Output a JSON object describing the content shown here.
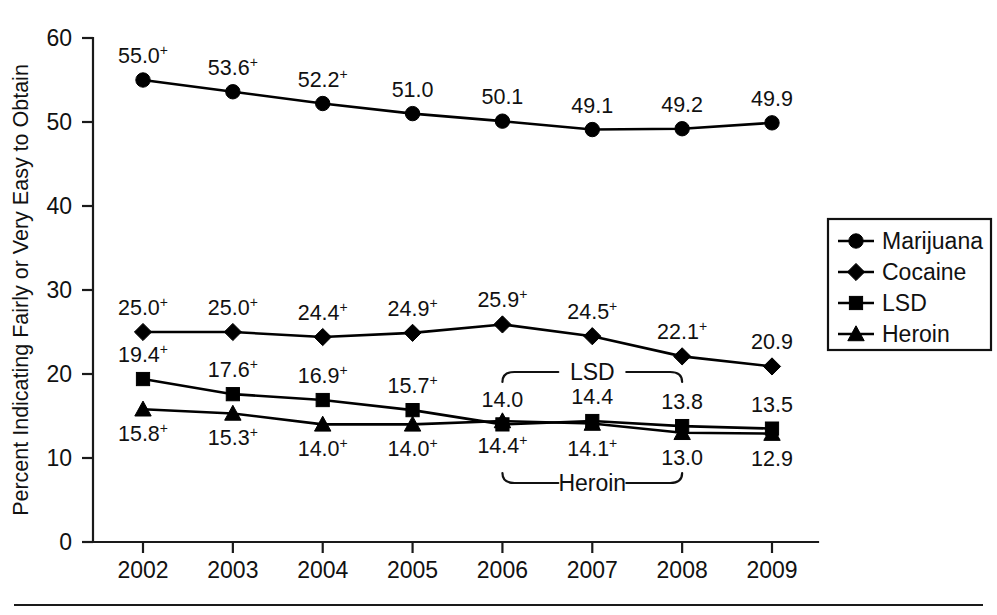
{
  "chart_data": {
    "type": "line",
    "title": "",
    "subtitle": "",
    "xlabel": "",
    "ylabel": "Percent Indicating Fairly or Very Easy to Obtain",
    "categories": [
      "2002",
      "2003",
      "2004",
      "2005",
      "2006",
      "2007",
      "2008",
      "2009"
    ],
    "x": [
      2002,
      2003,
      2004,
      2005,
      2006,
      2007,
      2008,
      2009
    ],
    "xlim": [
      2002,
      2009
    ],
    "ylim": [
      0,
      60
    ],
    "yticks": [
      0,
      10,
      20,
      30,
      40,
      50,
      60
    ],
    "ytick_labels": [
      "0",
      "10",
      "20",
      "30",
      "40",
      "50",
      "60"
    ],
    "grid": false,
    "legend_position": "right",
    "series": [
      {
        "name": "Marijuana",
        "marker": "circle",
        "values": [
          55.0,
          53.6,
          52.2,
          51.0,
          50.1,
          49.1,
          49.2,
          49.9
        ],
        "labels": [
          "55.0",
          "53.6",
          "52.2",
          "51.0",
          "50.1",
          "49.1",
          "49.2",
          "49.9"
        ],
        "significance": [
          "+",
          "+",
          "+",
          "",
          "",
          "",
          "",
          ""
        ],
        "label_position": "above"
      },
      {
        "name": "Cocaine",
        "marker": "diamond",
        "values": [
          25.0,
          25.0,
          24.4,
          24.9,
          25.9,
          24.5,
          22.1,
          20.9
        ],
        "labels": [
          "25.0",
          "25.0",
          "24.4",
          "24.9",
          "25.9",
          "24.5",
          "22.1",
          "20.9"
        ],
        "significance": [
          "+",
          "+",
          "+",
          "+",
          "+",
          "+",
          "+",
          ""
        ],
        "label_position": "above"
      },
      {
        "name": "LSD",
        "marker": "square",
        "values": [
          19.4,
          17.6,
          16.9,
          15.7,
          14.0,
          14.4,
          13.8,
          13.5
        ],
        "labels": [
          "19.4",
          "17.6",
          "16.9",
          "15.7",
          "14.0",
          "14.4",
          "13.8",
          "13.5"
        ],
        "significance": [
          "+",
          "+",
          "+",
          "+",
          "",
          "",
          "",
          ""
        ],
        "label_position": "above"
      },
      {
        "name": "Heroin",
        "marker": "triangle",
        "values": [
          15.8,
          15.3,
          14.0,
          14.0,
          14.4,
          14.1,
          13.0,
          12.9
        ],
        "labels": [
          "15.8",
          "15.3",
          "14.0",
          "14.0",
          "14.4",
          "14.1",
          "13.0",
          "12.9"
        ],
        "significance": [
          "+",
          "+",
          "+",
          "+",
          "+",
          "+",
          "",
          ""
        ],
        "label_position": "below"
      }
    ],
    "annotations": [
      {
        "text": "LSD",
        "from_category": "2006",
        "to_category": "2008",
        "orientation": "down",
        "series": "LSD"
      },
      {
        "text": "Heroin",
        "from_category": "2006",
        "to_category": "2008",
        "orientation": "up",
        "series": "Heroin"
      }
    ]
  },
  "legend": {
    "entries": [
      {
        "label": "Marijuana",
        "marker": "circle"
      },
      {
        "label": "Cocaine",
        "marker": "diamond"
      },
      {
        "label": "LSD",
        "marker": "square"
      },
      {
        "label": "Heroin",
        "marker": "triangle"
      }
    ]
  },
  "colors": {
    "ink": "#111111",
    "line": "#000000",
    "background": "#ffffff"
  }
}
